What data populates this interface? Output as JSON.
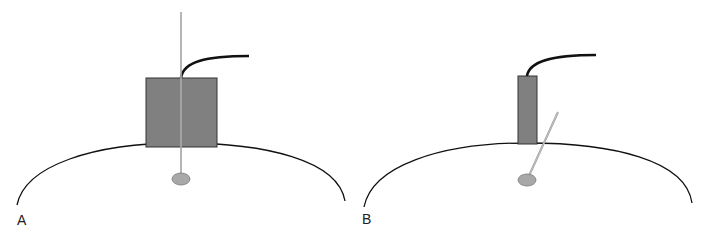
{
  "figure": {
    "panels": [
      {
        "label": "A",
        "description": "Probe block with vertical needle passing through it into target",
        "probe_shape": "square",
        "needle_orientation": "vertical"
      },
      {
        "label": "B",
        "description": "Narrow probe block with angled needle entering beside it toward target",
        "probe_shape": "narrow-rectangle",
        "needle_orientation": "angled"
      }
    ],
    "colors": {
      "outline": "#111111",
      "probe_fill": "#808080",
      "probe_stroke": "#333333",
      "cable": "#111111",
      "needle": "#a0a0a0",
      "target_fill": "#a8a8a8",
      "background": "#ffffff"
    }
  }
}
